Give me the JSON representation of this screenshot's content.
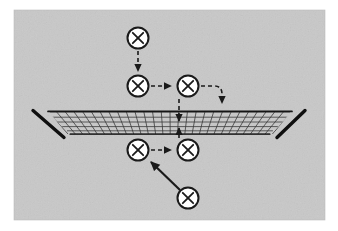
{
  "figure": {
    "width": 338,
    "height": 231,
    "background_color": "#ffffff"
  },
  "panel": {
    "name": "gray-background-panel",
    "x": 14,
    "y": 10,
    "width": 311,
    "height": 210,
    "fill_color": "#c8c8c8",
    "texture": "mottled-grain"
  },
  "mesh": {
    "name": "perspective-net",
    "description": "Flat quadrilateral net drawn in perspective, widest at bottom front",
    "line_color": "#2a2a2a",
    "edge_color": "#111111",
    "top_left": {
      "x": 48,
      "y": 112
    },
    "top_right": {
      "x": 292,
      "y": 112
    },
    "bottom_left": {
      "x": 68,
      "y": 134
    },
    "bottom_right": {
      "x": 272,
      "y": 134
    },
    "left_tip": {
      "x": 33,
      "y": 111
    },
    "right_tip": {
      "x": 305,
      "y": 111
    },
    "left_tail": {
      "x": 63,
      "y": 137
    },
    "right_tail": {
      "x": 278,
      "y": 137
    },
    "rows": 5,
    "columns": 28
  },
  "nodes": [
    {
      "id": "n1",
      "label": "cross-node",
      "cx": 138,
      "cy": 38,
      "r": 11
    },
    {
      "id": "n2",
      "label": "cross-node",
      "cx": 138,
      "cy": 86,
      "r": 11
    },
    {
      "id": "n3",
      "label": "cross-node",
      "cx": 188,
      "cy": 86,
      "r": 11
    },
    {
      "id": "n4",
      "label": "cross-node",
      "cx": 138,
      "cy": 150,
      "r": 11
    },
    {
      "id": "n5",
      "label": "cross-node",
      "cx": 188,
      "cy": 150,
      "r": 11
    },
    {
      "id": "n6",
      "label": "cross-node",
      "cx": 188,
      "cy": 198,
      "r": 11
    }
  ],
  "node_style": {
    "fill_color": "#ffffff",
    "stroke_color": "#1a1a1a",
    "stroke_width": 2,
    "glyph": "cross-x",
    "glyph_color": "#1a1a1a"
  },
  "arrows": [
    {
      "id": "a1",
      "name": "arrow-top-to-upper-left-node",
      "style": "dashed",
      "from": "n1",
      "to": "n2",
      "path": "M 138 51 L 138 72"
    },
    {
      "id": "a2",
      "name": "arrow-upper-left-to-upper-right-node",
      "style": "dashed",
      "from": "n2",
      "to": "n3",
      "path": "M 151 86 L 172 86"
    },
    {
      "id": "a3",
      "name": "arrow-upper-right-node-curving-into-mesh",
      "style": "dashed",
      "from": "n3",
      "to": "mesh",
      "path": "M 201 86 L 214 86 Q 222 86 222 94 L 222 104"
    },
    {
      "id": "a4",
      "name": "arrow-upper-center-down-into-mesh",
      "style": "dashed",
      "from": "upper-center",
      "to": "mesh-center",
      "path": "M 179 100 L 179 122"
    },
    {
      "id": "a5",
      "name": "arrow-lower-center-up-into-mesh",
      "style": "dashed",
      "from": "lower-center",
      "to": "mesh-center",
      "path": "M 179 137 L 179 127"
    },
    {
      "id": "a6",
      "name": "arrow-lower-left-to-lower-right-node",
      "style": "dashed",
      "from": "n4",
      "to": "n5",
      "path": "M 151 150 L 172 150"
    },
    {
      "id": "a7",
      "name": "arrow-bottom-node-to-lower-left-node",
      "style": "solid",
      "from": "n6",
      "to": "n4",
      "path": "M 180 190 L 150 161"
    }
  ],
  "arrow_style": {
    "stroke_color": "#1a1a1a",
    "dashed_pattern": "4 3",
    "stroke_width_dashed": 1.6,
    "stroke_width_solid": 2.2,
    "head_fill": "#1a1a1a"
  }
}
